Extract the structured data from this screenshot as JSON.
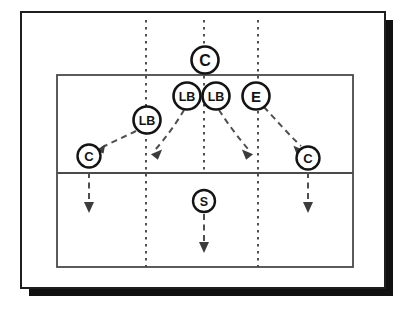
{
  "diagram": {
    "type": "sports-play-diagram",
    "colors": {
      "ink": "#1a1a1a",
      "court_line": "#555555",
      "dotted_line": "#555555",
      "arrow": "#555555",
      "shadow": "#111111",
      "paper": "#ffffff"
    },
    "frame": {
      "outer": {
        "x": 21,
        "y": 12,
        "width": 364,
        "height": 276,
        "stroke_width": 2
      },
      "shadow_offset": {
        "x": 8,
        "y": 8
      }
    },
    "court": {
      "x": 57,
      "y": 75,
      "width": 296,
      "height": 192,
      "midline_y": 173,
      "stroke_width": 1.6
    },
    "dotted_lines": [
      {
        "name": "left-lane-line",
        "x": 146,
        "y1": 20,
        "y2": 267
      },
      {
        "name": "center-lane-line",
        "x": 204,
        "y1": 20,
        "y2": 173
      },
      {
        "name": "right-lane-line",
        "x": 258,
        "y1": 20,
        "y2": 267
      }
    ],
    "players": [
      {
        "id": "coach-top",
        "label": "C",
        "cx": 205,
        "cy": 60,
        "r": 13.5,
        "font_size": 15
      },
      {
        "id": "lb-center-left",
        "label": "LB",
        "cx": 187,
        "cy": 96,
        "r": 13.5,
        "font_size": 12
      },
      {
        "id": "lb-center-right",
        "label": "LB",
        "cx": 216,
        "cy": 96,
        "r": 13.5,
        "font_size": 12
      },
      {
        "id": "end-right",
        "label": "E",
        "cx": 256,
        "cy": 96,
        "r": 13.5,
        "font_size": 14
      },
      {
        "id": "lb-left",
        "label": "LB",
        "cx": 147,
        "cy": 120,
        "r": 13.5,
        "font_size": 12
      },
      {
        "id": "corner-left",
        "label": "C",
        "cx": 89,
        "cy": 156,
        "r": 11.5,
        "font_size": 12
      },
      {
        "id": "corner-right",
        "label": "C",
        "cx": 308,
        "cy": 158,
        "r": 11.5,
        "font_size": 12
      },
      {
        "id": "safety",
        "label": "S",
        "cx": 204,
        "cy": 201,
        "r": 11,
        "font_size": 12
      }
    ],
    "motion_arrows": [
      {
        "name": "lb-left-to-corner-left",
        "path": "M 136 131 L 122 137 L 108 145 L 99 150",
        "head": 200
      },
      {
        "name": "lb-center-left-to-down-left",
        "path": "M 184 110 L 173 125 L 162 140 L 153 152",
        "head": 232
      },
      {
        "name": "lb-center-right-to-down-right",
        "path": "M 219 110 L 230 125 L 241 140 L 250 152",
        "head": 308
      },
      {
        "name": "end-to-corner-right",
        "path": "M 263 107 L 278 122 L 293 137 L 302 147",
        "head": 308
      },
      {
        "name": "corner-left-down",
        "path": "M 89 172 L 89 195 L 89 213",
        "head": 270
      },
      {
        "name": "corner-right-down",
        "path": "M 308 172 L 308 195 L 308 213",
        "head": 270
      },
      {
        "name": "safety-down",
        "path": "M 204 214 L 204 235 L 204 252",
        "head": 270
      }
    ]
  }
}
